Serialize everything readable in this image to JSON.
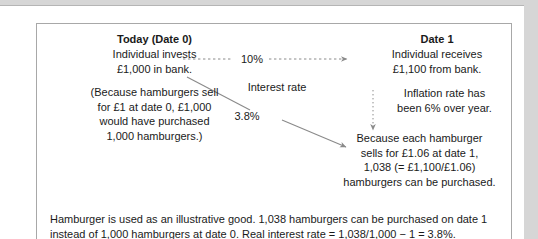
{
  "exhibit": {
    "today_column": {
      "heading": "Today (Date 0)",
      "line1": "Individual invests",
      "line2": "£1,000 in bank.",
      "paren_line1": "(Because hamburgers sell",
      "paren_line2": "for £1 at date 0, £1,000",
      "paren_line3": "would have purchased",
      "paren_line4": "1,000 hamburgers.)"
    },
    "date1_column": {
      "heading": "Date 1",
      "line1": "Individual receives",
      "line2": "£1,100 from bank.",
      "inflation_line1": "Inflation rate has",
      "inflation_line2": "been 6% over year.",
      "burgers_line1": "Because each hamburger",
      "burgers_line2": "sells for £1.06 at date 1,",
      "burgers_line3": "1,038 (= £1,100/£1.06)",
      "burgers_line4": "hamburgers can be purchased."
    },
    "middle": {
      "nominal_rate": "10%",
      "interest_rate_label": "Interest rate",
      "real_rate": "3.8%"
    },
    "footnote": {
      "line1": "Hamburger is used as an illustrative good. 1,038 hamburgers can be purchased on date 1",
      "line2": "instead of 1,000 hamburgers at date 0.  Real interest rate = 1,038/1,000 − 1 = 3.8%."
    },
    "colors": {
      "text": "#1a1a1a",
      "border": "#a8a8a8",
      "arrow": "#8a8a8a",
      "page_background": "#d6d6d6",
      "sheet": "#ffffff"
    },
    "icons": {
      "nominal_arrow": "dashed-arrow-right-icon",
      "inflation_arrow": "dotted-arrow-down-icon",
      "real_arrow": "diagonal-arrow-down-right-icon"
    }
  }
}
